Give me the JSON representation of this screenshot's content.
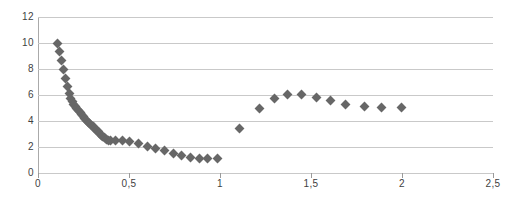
{
  "chart_data": {
    "type": "scatter",
    "title": "",
    "subtitle": "",
    "xlabel": "",
    "ylabel": "",
    "xlim": [
      0,
      2.5
    ],
    "ylim": [
      0,
      12
    ],
    "grid": true,
    "legend": null,
    "decimal_separator": ",",
    "marker": {
      "shape": "diamond",
      "color": "#676767",
      "size_px": 7
    },
    "xticks": [
      0,
      0.5,
      1,
      1.5,
      2,
      2.5
    ],
    "xtick_labels": [
      "0",
      "0,5",
      "1",
      "1,5",
      "2",
      "2,5"
    ],
    "yticks": [
      0,
      2,
      4,
      6,
      8,
      10,
      12
    ],
    "ytick_labels": [
      "0",
      "2",
      "4",
      "6",
      "8",
      "10",
      "12"
    ],
    "series": [
      {
        "name": "series-1",
        "points": [
          [
            0.105,
            10.0
          ],
          [
            0.118,
            9.35
          ],
          [
            0.13,
            8.65
          ],
          [
            0.14,
            7.95
          ],
          [
            0.15,
            7.3
          ],
          [
            0.16,
            6.65
          ],
          [
            0.172,
            6.1
          ],
          [
            0.18,
            5.75
          ],
          [
            0.188,
            5.5
          ],
          [
            0.196,
            5.3
          ],
          [
            0.205,
            5.1
          ],
          [
            0.213,
            4.95
          ],
          [
            0.222,
            4.8
          ],
          [
            0.231,
            4.65
          ],
          [
            0.24,
            4.5
          ],
          [
            0.249,
            4.35
          ],
          [
            0.258,
            4.2
          ],
          [
            0.267,
            4.05
          ],
          [
            0.276,
            3.92
          ],
          [
            0.285,
            3.8
          ],
          [
            0.294,
            3.68
          ],
          [
            0.303,
            3.55
          ],
          [
            0.312,
            3.42
          ],
          [
            0.321,
            3.3
          ],
          [
            0.33,
            3.18
          ],
          [
            0.339,
            3.05
          ],
          [
            0.348,
            2.92
          ],
          [
            0.357,
            2.8
          ],
          [
            0.366,
            2.7
          ],
          [
            0.375,
            2.6
          ],
          [
            0.385,
            2.52
          ],
          [
            0.398,
            2.48
          ],
          [
            0.425,
            2.5
          ],
          [
            0.462,
            2.5
          ],
          [
            0.505,
            2.42
          ],
          [
            0.552,
            2.25
          ],
          [
            0.6,
            2.05
          ],
          [
            0.648,
            1.85
          ],
          [
            0.695,
            1.7
          ],
          [
            0.742,
            1.52
          ],
          [
            0.79,
            1.35
          ],
          [
            0.838,
            1.22
          ],
          [
            0.885,
            1.15
          ],
          [
            0.932,
            1.1
          ],
          [
            0.985,
            1.1
          ],
          [
            1.105,
            3.4
          ],
          [
            1.215,
            5.0
          ],
          [
            1.3,
            5.75
          ],
          [
            1.37,
            6.05
          ],
          [
            1.45,
            6.05
          ],
          [
            1.53,
            5.8
          ],
          [
            1.605,
            5.55
          ],
          [
            1.69,
            5.3
          ],
          [
            1.795,
            5.15
          ],
          [
            1.89,
            5.05
          ],
          [
            1.995,
            5.05
          ]
        ]
      }
    ]
  }
}
